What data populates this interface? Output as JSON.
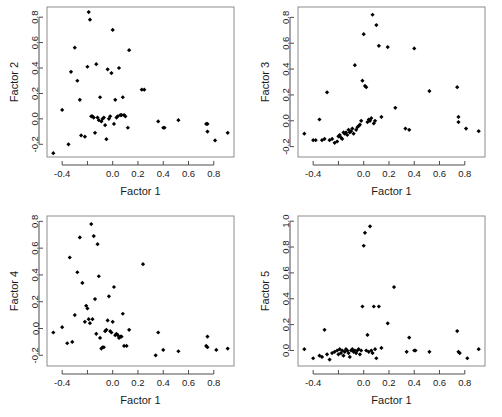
{
  "figure": {
    "type": "scatter-plot-matrix",
    "panel_count": 4,
    "background_color": "#ffffff",
    "frame_color": "#8c8c8c",
    "point_color": "#000000",
    "point_marker": "filled-diamond"
  },
  "chart_data": [
    {
      "type": "scatter",
      "title": "",
      "xlabel": "Factor 1",
      "ylabel": "Factor 2",
      "xlim": [
        -0.52,
        0.96
      ],
      "ylim": [
        -0.3,
        0.88
      ],
      "xticks": [
        -0.4,
        -0.2,
        0.0,
        0.2,
        0.4,
        0.6,
        0.8
      ],
      "xtick_labels": [
        "-0.4",
        "",
        "0.0",
        "0.2",
        "0.4",
        "0.6",
        "0.8"
      ],
      "yticks": [
        -0.2,
        0.0,
        0.2,
        0.4,
        0.6,
        0.8
      ],
      "ytick_labels": [
        "-0.2",
        "0.0",
        "0.2",
        "0.4",
        "0.6",
        "0.8"
      ],
      "grid": false,
      "legend": "none",
      "x": [
        -0.47,
        -0.4,
        -0.35,
        -0.33,
        -0.3,
        -0.28,
        -0.26,
        -0.25,
        -0.22,
        -0.2,
        -0.19,
        -0.18,
        -0.17,
        -0.16,
        -0.15,
        -0.14,
        -0.13,
        -0.12,
        -0.11,
        -0.1,
        -0.09,
        -0.08,
        -0.07,
        -0.06,
        -0.05,
        -0.04,
        -0.03,
        -0.02,
        -0.01,
        0.0,
        0.01,
        0.02,
        0.03,
        0.04,
        0.05,
        0.06,
        0.07,
        0.08,
        0.09,
        0.1,
        0.12,
        0.13,
        0.23,
        0.25,
        0.36,
        0.4,
        0.41,
        0.52,
        0.74,
        0.75,
        0.75,
        0.81,
        0.91
      ],
      "y": [
        -0.27,
        0.07,
        -0.2,
        0.37,
        0.56,
        0.3,
        0.15,
        -0.13,
        -0.14,
        0.41,
        0.84,
        0.78,
        0.02,
        0.02,
        0.01,
        -0.11,
        0.43,
        0.01,
        -0.01,
        0.17,
        -0.02,
        0.0,
        0.01,
        -0.05,
        -0.16,
        0.39,
        0.0,
        0.02,
        0.36,
        0.7,
        -0.04,
        0.15,
        0.01,
        0.02,
        0.4,
        0.03,
        0.03,
        0.17,
        0.03,
        0.02,
        -0.07,
        0.54,
        0.23,
        0.23,
        -0.02,
        -0.07,
        -0.07,
        -0.01,
        -0.04,
        -0.04,
        -0.1,
        -0.17,
        -0.11
      ]
    },
    {
      "type": "scatter",
      "title": "",
      "xlabel": "Factor 1",
      "ylabel": "Factor 3",
      "xlim": [
        -0.52,
        0.96
      ],
      "ylim": [
        -0.28,
        0.88
      ],
      "xticks": [
        -0.4,
        -0.2,
        0.0,
        0.2,
        0.4,
        0.6,
        0.8
      ],
      "xtick_labels": [
        "-0.4",
        "",
        "0.0",
        "0.2",
        "0.4",
        "0.6",
        "0.8"
      ],
      "yticks": [
        -0.2,
        0.0,
        0.2,
        0.4,
        0.6,
        0.8
      ],
      "ytick_labels": [
        "-0.2",
        "0.0",
        "0.2",
        "0.4",
        "0.6",
        "0.8"
      ],
      "grid": false,
      "legend": "none",
      "x": [
        -0.47,
        -0.4,
        -0.38,
        -0.35,
        -0.33,
        -0.31,
        -0.29,
        -0.27,
        -0.25,
        -0.23,
        -0.21,
        -0.2,
        -0.19,
        -0.18,
        -0.17,
        -0.16,
        -0.15,
        -0.14,
        -0.13,
        -0.12,
        -0.11,
        -0.1,
        -0.09,
        -0.08,
        -0.07,
        -0.06,
        -0.05,
        -0.04,
        -0.03,
        -0.02,
        -0.01,
        0.0,
        0.01,
        0.02,
        0.03,
        0.04,
        0.05,
        0.06,
        0.07,
        0.08,
        0.09,
        0.1,
        0.12,
        0.14,
        0.19,
        0.25,
        0.33,
        0.36,
        0.4,
        0.52,
        0.74,
        0.75,
        0.75,
        0.81,
        0.91
      ],
      "y": [
        -0.1,
        -0.15,
        -0.15,
        0.01,
        -0.15,
        -0.14,
        0.22,
        -0.15,
        -0.14,
        -0.17,
        -0.16,
        -0.12,
        -0.11,
        -0.13,
        -0.14,
        -0.09,
        -0.1,
        -0.09,
        -0.11,
        -0.07,
        -0.09,
        -0.08,
        -0.06,
        -0.1,
        0.43,
        -0.07,
        -0.05,
        -0.04,
        -0.03,
        0.0,
        0.31,
        0.67,
        0.27,
        0.26,
        -0.01,
        0.01,
        0.0,
        0.02,
        0.82,
        -0.02,
        0.0,
        0.74,
        0.58,
        0.03,
        0.57,
        0.1,
        -0.06,
        -0.07,
        0.56,
        0.23,
        0.26,
        0.03,
        -0.01,
        -0.06,
        -0.08
      ]
    },
    {
      "type": "scatter",
      "title": "",
      "xlabel": "Factor 1",
      "ylabel": "Factor 4",
      "xlim": [
        -0.52,
        0.96
      ],
      "ylim": [
        -0.28,
        0.84
      ],
      "xticks": [
        -0.4,
        -0.2,
        0.0,
        0.2,
        0.4,
        0.6,
        0.8
      ],
      "xtick_labels": [
        "-0.4",
        "",
        "0.0",
        "0.2",
        "0.4",
        "0.6",
        "0.8"
      ],
      "yticks": [
        -0.2,
        0.0,
        0.2,
        0.4,
        0.6,
        0.8
      ],
      "ytick_labels": [
        "-0.2",
        "0.0",
        "0.2",
        "0.4",
        "0.6",
        "0.8"
      ],
      "grid": false,
      "legend": "none",
      "x": [
        -0.47,
        -0.4,
        -0.36,
        -0.34,
        -0.32,
        -0.3,
        -0.28,
        -0.26,
        -0.24,
        -0.22,
        -0.21,
        -0.2,
        -0.19,
        -0.18,
        -0.17,
        -0.16,
        -0.15,
        -0.14,
        -0.13,
        -0.12,
        -0.11,
        -0.1,
        -0.09,
        -0.08,
        -0.07,
        -0.06,
        -0.05,
        -0.04,
        -0.03,
        -0.02,
        -0.01,
        0.0,
        0.01,
        0.02,
        0.03,
        0.04,
        0.05,
        0.06,
        0.07,
        0.08,
        0.09,
        0.11,
        0.13,
        0.24,
        0.34,
        0.36,
        0.4,
        0.52,
        0.74,
        0.75,
        0.75,
        0.82,
        0.91
      ],
      "y": [
        -0.03,
        0.01,
        -0.11,
        0.53,
        -0.1,
        0.1,
        0.42,
        0.68,
        0.34,
        0.05,
        0.17,
        0.15,
        0.07,
        0.04,
        0.78,
        0.07,
        0.69,
        0.22,
        -0.04,
        0.63,
        0.39,
        -0.07,
        -0.15,
        -0.14,
        -0.14,
        -0.02,
        -0.01,
        0.06,
        0.24,
        -0.02,
        -0.03,
        0.05,
        0.31,
        -0.05,
        -0.04,
        -0.05,
        -0.07,
        -0.06,
        -0.06,
        0.11,
        -0.13,
        -0.13,
        -0.01,
        0.48,
        -0.2,
        -0.03,
        -0.16,
        -0.17,
        -0.13,
        -0.14,
        -0.06,
        -0.16,
        -0.15
      ]
    },
    {
      "type": "scatter",
      "title": "",
      "xlabel": "Factor 1",
      "ylabel": "Factor 5",
      "xlim": [
        -0.52,
        0.96
      ],
      "ylim": [
        -0.12,
        1.04
      ],
      "xticks": [
        -0.4,
        -0.2,
        0.0,
        0.2,
        0.4,
        0.6,
        0.8
      ],
      "xtick_labels": [
        "-0.4",
        "",
        "0.0",
        "0.2",
        "0.4",
        "0.6",
        "0.8"
      ],
      "yticks": [
        0.0,
        0.2,
        0.4,
        0.6,
        0.8,
        1.0
      ],
      "ytick_labels": [
        "0.0",
        "0.2",
        "0.4",
        "0.6",
        "0.8",
        "1.0"
      ],
      "grid": false,
      "legend": "none",
      "x": [
        -0.47,
        -0.4,
        -0.35,
        -0.33,
        -0.31,
        -0.29,
        -0.27,
        -0.25,
        -0.23,
        -0.21,
        -0.2,
        -0.19,
        -0.18,
        -0.17,
        -0.16,
        -0.15,
        -0.14,
        -0.13,
        -0.12,
        -0.11,
        -0.1,
        -0.09,
        -0.08,
        -0.07,
        -0.06,
        -0.05,
        -0.04,
        -0.03,
        -0.02,
        -0.01,
        0.0,
        0.01,
        0.02,
        0.03,
        0.04,
        0.05,
        0.06,
        0.07,
        0.08,
        0.09,
        0.1,
        0.12,
        0.14,
        0.19,
        0.24,
        0.34,
        0.36,
        0.4,
        0.41,
        0.52,
        0.74,
        0.75,
        0.76,
        0.82,
        0.91
      ],
      "y": [
        0.01,
        -0.06,
        -0.04,
        -0.05,
        0.16,
        -0.03,
        -0.07,
        -0.02,
        -0.01,
        0.0,
        -0.03,
        0.01,
        -0.02,
        0.0,
        -0.04,
        -0.01,
        0.01,
        0.0,
        -0.02,
        -0.05,
        0.0,
        0.01,
        -0.01,
        0.0,
        -0.02,
        0.0,
        0.01,
        -0.03,
        0.0,
        0.34,
        0.81,
        0.91,
        0.0,
        0.12,
        -0.01,
        0.96,
        0.0,
        -0.02,
        0.34,
        0.01,
        -0.06,
        0.34,
        0.02,
        0.21,
        0.49,
        -0.01,
        0.1,
        0.0,
        0.0,
        -0.01,
        0.15,
        -0.01,
        -0.02,
        -0.06,
        0.01
      ]
    }
  ]
}
